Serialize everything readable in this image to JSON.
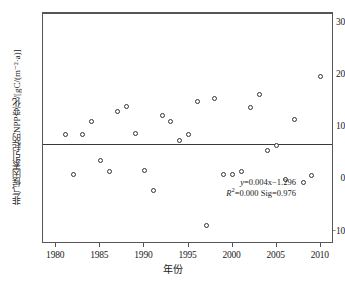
{
  "chart_data": {
    "type": "scatter",
    "title": "",
    "xlabel": "年份",
    "ylabel": "非气候因素引起的NPP变化/[gC/(m⁻²·a)]",
    "xlim": [
      1978.5,
      2011.5
    ],
    "ylim": [
      -12.4,
      32.0
    ],
    "xticks": [
      1980,
      1985,
      1990,
      1995,
      2000,
      2005,
      2010
    ],
    "yticks": [
      30,
      20,
      10,
      0,
      -10
    ],
    "grid": false,
    "legend": "none",
    "x": [
      1981,
      1982,
      1983,
      1984,
      1985,
      1986,
      1987,
      1988,
      1989,
      1990,
      1991,
      1992,
      1993,
      1994,
      1995,
      1996,
      1997,
      1998,
      1999,
      2000,
      2001,
      2002,
      2003,
      2004,
      2005,
      2006,
      2007,
      2008,
      2009,
      2010
    ],
    "y": [
      8.9,
      1.2,
      8.9,
      11.3,
      3.9,
      1.7,
      13.3,
      14.2,
      9.0,
      1.9,
      -2.0,
      12.5,
      11.4,
      7.7,
      8.8,
      15.2,
      -8.7,
      15.8,
      1.2,
      1.1,
      1.7,
      14.1,
      16.6,
      5.7,
      6.7,
      0.1,
      11.8,
      -0.4,
      0.9,
      20.0
    ],
    "series": [
      {
        "name": "非气候因素引起的NPP变化",
        "marker": "open-circle",
        "color": "#333333"
      }
    ],
    "trendline": {
      "equation": "y=0.004x−1.296",
      "slope": 0.004,
      "intercept": -1.296,
      "r_squared": "0.000",
      "significance": "0.976",
      "value_at_left": 7.0,
      "value_at_right": 7.15,
      "color": "#3a3a3a"
    },
    "annotation": {
      "line1_lead": "y",
      "line1_rest": "=0.004x−1.296",
      "line2_lead": "R",
      "line2_sup": "2",
      "line2_rest": "=0.000  Sig=0.976"
    }
  },
  "axes": {
    "y_title": "非气候因素引起的NPP变化/[gC/(m⁻²·a)]",
    "x_title": "年份",
    "ytick_labels": [
      "30",
      "20",
      "10",
      "0",
      "−10"
    ],
    "xtick_labels": [
      "1980",
      "1985",
      "1990",
      "1995",
      "2000",
      "2005",
      "2010"
    ]
  },
  "colors": {
    "frame": "#555555",
    "marker_edge": "#333333",
    "trend": "#3a3a3a",
    "background": "#ffffff",
    "text": "#1a1a1a"
  }
}
